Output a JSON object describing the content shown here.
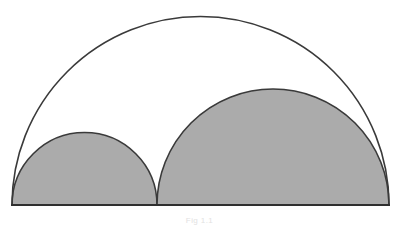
{
  "figure": {
    "caption": "Fig 1.1",
    "colors": {
      "background": "#ffffff",
      "fill_shaded": "#ababab",
      "stroke": "#3a3a3a",
      "baseline": "#2f2f2f",
      "caption_text": "#e2e2e2"
    },
    "stroke_width_px": 1.6,
    "baseline_width_px": 2.0
  },
  "chart_data": {
    "type": "diagram",
    "xlabel": "",
    "ylabel": "",
    "xlim": [
      0,
      399
    ],
    "ylim": [
      0,
      227
    ],
    "grid": false,
    "legend": "none",
    "baseline": {
      "label": "baseline",
      "x1": 12,
      "y1": 205,
      "x2": 389,
      "y2": 205,
      "length": 377
    },
    "points": [
      {
        "label": "A (left endpoint)",
        "x": 12,
        "y": 205
      },
      {
        "label": "C (junction point)",
        "x": 157,
        "y": 205
      },
      {
        "label": "B (right endpoint)",
        "x": 389,
        "y": 205
      },
      {
        "label": "apex of large arc",
        "x": 200,
        "y": 16
      },
      {
        "label": "apex of small semicircle",
        "x": 85,
        "y": 133
      },
      {
        "label": "apex of medium semicircle",
        "x": 273,
        "y": 89
      }
    ],
    "series": [
      {
        "name": "large-outer-arc",
        "shape": "semicircle",
        "filled": false,
        "fill": "none",
        "stroke": "#3a3a3a",
        "center_x": 200.5,
        "center_y": 205,
        "radius": 188.5,
        "diameter": 377,
        "apex_y": 16,
        "start_x": 12,
        "end_x": 389
      },
      {
        "name": "small-shaded-semicircle",
        "shape": "semicircle",
        "filled": true,
        "fill": "#ababab",
        "stroke": "#3a3a3a",
        "center_x": 84.5,
        "center_y": 205,
        "radius": 72.5,
        "diameter": 145,
        "apex_y": 132.5,
        "start_x": 12,
        "end_x": 157
      },
      {
        "name": "medium-shaded-semicircle",
        "shape": "semicircle",
        "filled": true,
        "fill": "#ababab",
        "stroke": "#3a3a3a",
        "center_x": 273,
        "center_y": 205,
        "radius": 116,
        "diameter": 232,
        "apex_y": 89,
        "start_x": 157,
        "end_x": 389
      }
    ],
    "annotations": [
      {
        "text": "Fig 1.1",
        "x": 199,
        "y": 221,
        "role": "caption"
      }
    ]
  }
}
